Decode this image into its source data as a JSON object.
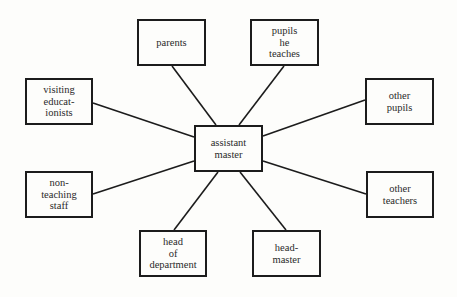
{
  "diagram": {
    "type": "hub-and-spoke",
    "center": {
      "id": "assistant-master",
      "lines": [
        "assistant",
        "master"
      ],
      "box": [
        194,
        125,
        69,
        47
      ]
    },
    "nodes": [
      {
        "id": "parents",
        "lines": [
          "parents"
        ],
        "box": [
          137,
          19,
          69,
          47
        ],
        "edge": [
          172,
          66,
          216,
          125
        ]
      },
      {
        "id": "pupils-he-teaches",
        "lines": [
          "pupils",
          "he",
          "teaches"
        ],
        "box": [
          250,
          19,
          69,
          47
        ],
        "edge": [
          284,
          66,
          239,
          125
        ]
      },
      {
        "id": "visiting-educationists",
        "lines": [
          "visiting",
          "educat-",
          "ionists"
        ],
        "box": [
          25,
          78,
          68,
          47
        ],
        "edge": [
          93,
          103,
          194,
          137
        ]
      },
      {
        "id": "other-pupils",
        "lines": [
          "other",
          "pupils"
        ],
        "box": [
          365,
          78,
          69,
          47
        ],
        "edge": [
          365,
          100,
          263,
          136
        ]
      },
      {
        "id": "non-teaching-staff",
        "lines": [
          "non-",
          "teaching",
          "staff"
        ],
        "box": [
          25,
          171,
          68,
          47
        ],
        "edge": [
          93,
          194,
          194,
          161
        ]
      },
      {
        "id": "other-teachers",
        "lines": [
          "other",
          "teachers"
        ],
        "box": [
          366,
          171,
          68,
          47
        ],
        "edge": [
          366,
          194,
          263,
          161
        ]
      },
      {
        "id": "head-of-department",
        "lines": [
          "head",
          "of",
          "department"
        ],
        "box": [
          139,
          230,
          68,
          47
        ],
        "edge": [
          174,
          230,
          218,
          172
        ]
      },
      {
        "id": "head-master",
        "lines": [
          "head-",
          "master"
        ],
        "box": [
          252,
          230,
          69,
          47
        ],
        "edge": [
          286,
          230,
          240,
          172
        ]
      }
    ],
    "colors": {
      "background": "#fdfdfb",
      "stroke": "#1c1c1c",
      "text": "#2a2a2a"
    }
  }
}
